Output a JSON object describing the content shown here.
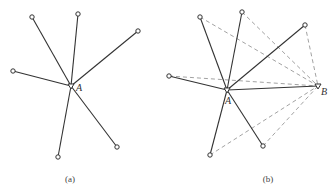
{
  "figure": {
    "panels": [
      {
        "caption": "(a)",
        "caption_pos": [
          70,
          182
        ],
        "hub": {
          "label": "A",
          "pos": [
            71,
            86
          ],
          "label_pos": [
            76,
            91
          ]
        },
        "spokes": [
          [
            32,
            17
          ],
          [
            78,
            14
          ],
          [
            138,
            31
          ],
          [
            13,
            71
          ],
          [
            58,
            157
          ],
          [
            117,
            147
          ]
        ]
      },
      {
        "caption": "(b)",
        "caption_pos": [
          268,
          182
        ],
        "hub": {
          "label": "A",
          "pos": [
            227,
            90
          ],
          "label_pos": [
            225,
            104
          ]
        },
        "second_hub": {
          "label": "B",
          "pos": [
            318,
            86
          ],
          "label_pos": [
            321,
            95
          ]
        },
        "spokes": [
          [
            200,
            17
          ],
          [
            242,
            12
          ],
          [
            305,
            25
          ],
          [
            169,
            76
          ],
          [
            210,
            155
          ],
          [
            263,
            146
          ]
        ],
        "dashed_links_to_B": [
          [
            200,
            17
          ],
          [
            242,
            12
          ],
          [
            305,
            25
          ],
          [
            169,
            76
          ],
          [
            210,
            155
          ],
          [
            263,
            146
          ]
        ]
      }
    ]
  }
}
